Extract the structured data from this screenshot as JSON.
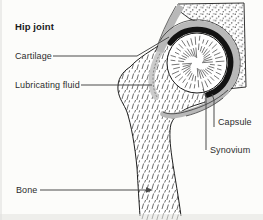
{
  "figure": {
    "title": "Hip joint",
    "labels": {
      "cartilage": "Cartilage",
      "lubricating_fluid": "Lubricating fluid",
      "capsule": "Capsule",
      "synovium": "Synovium",
      "bone": "Bone"
    },
    "colors": {
      "background": "#fcfcfa",
      "ink": "#1f1f1f",
      "cartilage_ring": "#121212",
      "capsule_band": "#b8b8b8",
      "fluid_gray": "#cbcbcb",
      "leader_line": "#4a4a4a",
      "label_text": "#2d2d2d"
    }
  }
}
